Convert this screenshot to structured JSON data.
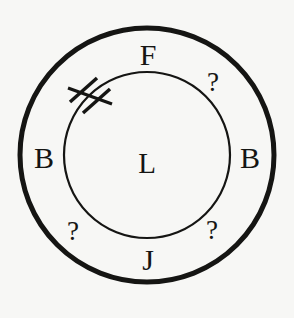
{
  "figure": {
    "type": "concentric-circle-diagram",
    "background_color": "#f7f7f5",
    "ink_color": "#151513",
    "center_label": "L",
    "outer_ring_labels": [
      {
        "text": "F",
        "position": "top",
        "angle_deg": 270
      },
      {
        "text": "?",
        "position": "upper-right",
        "angle_deg": 315
      },
      {
        "text": "B",
        "position": "right",
        "angle_deg": 0
      },
      {
        "text": "?",
        "position": "lower-right",
        "angle_deg": 45
      },
      {
        "text": "J",
        "position": "bottom",
        "angle_deg": 90
      },
      {
        "text": "?",
        "position": "lower-left",
        "angle_deg": 135
      },
      {
        "text": "B",
        "position": "left",
        "angle_deg": 180
      }
    ],
    "marks": [
      {
        "name": "double-hash-mark",
        "position": "upper-left",
        "stroke_count": 2
      }
    ],
    "geometry": {
      "center_x": 147,
      "center_y": 155,
      "outer_radius": 127,
      "outer_stroke_width": 5,
      "inner_radius": 83,
      "inner_stroke_width": 2
    }
  }
}
